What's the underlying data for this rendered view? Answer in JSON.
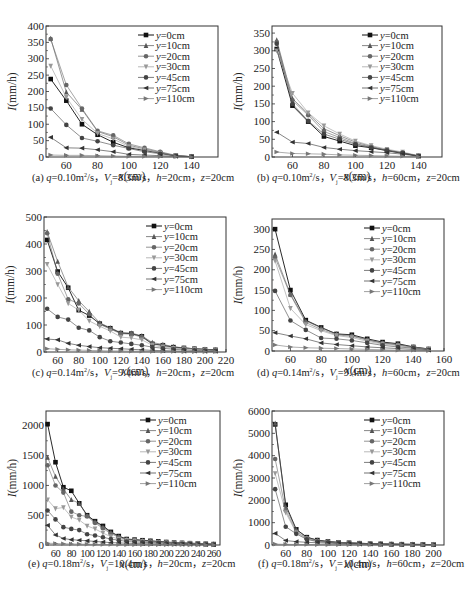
{
  "series_names": [
    "y=0cm",
    "y=10cm",
    "y=20cm",
    "y=30cm",
    "y=45cm",
    "y=75cm",
    "y=110cm"
  ],
  "styles": {
    "colors": [
      "#111111",
      "#555555",
      "#666666",
      "#999999",
      "#444444",
      "#333333",
      "#777777"
    ],
    "markers": [
      "square",
      "triangle",
      "circle",
      "tri-down",
      "circle",
      "tri-left",
      "tri-right"
    ]
  },
  "chart_data": [
    {
      "id": "a",
      "type": "line",
      "caption": {
        "label": "(a)",
        "q": "0.10",
        "Vj": "8.3",
        "h": "20",
        "z": "20"
      },
      "xlabel": "x(cm)",
      "ylabel": "I(mm/h)",
      "xlim": [
        47,
        157
      ],
      "ylim": [
        0,
        400
      ],
      "xticks": [
        60,
        80,
        100,
        120,
        140
      ],
      "yticks": [
        0,
        50,
        100,
        150,
        200,
        250,
        300,
        350,
        400
      ],
      "x": [
        50,
        60,
        70,
        80,
        90,
        100,
        110,
        120,
        130,
        140
      ],
      "series": [
        {
          "name": "y=0cm",
          "values": [
            238,
            172,
            100,
            68,
            45,
            28,
            20,
            12,
            4,
            1
          ]
        },
        {
          "name": "y=10cm",
          "values": [
            362,
            198,
            145,
            78,
            62,
            36,
            25,
            14,
            4,
            1
          ]
        },
        {
          "name": "y=20cm",
          "values": [
            360,
            220,
            148,
            80,
            66,
            40,
            28,
            16,
            5,
            1
          ]
        },
        {
          "name": "y=30cm",
          "values": [
            278,
            182,
            115,
            72,
            55,
            32,
            22,
            12,
            4,
            1
          ]
        },
        {
          "name": "y=45cm",
          "values": [
            148,
            98,
            58,
            48,
            36,
            26,
            16,
            10,
            3,
            1
          ]
        },
        {
          "name": "y=75cm",
          "values": [
            60,
            28,
            27,
            22,
            16,
            8,
            6,
            4,
            2,
            1
          ]
        },
        {
          "name": "y=110cm",
          "values": [
            6,
            5,
            5,
            4,
            3,
            2,
            2,
            1,
            1,
            0
          ]
        }
      ]
    },
    {
      "id": "b",
      "type": "line",
      "caption": {
        "label": "(b)",
        "q": "0.10",
        "Vj": "8.3",
        "h": "60",
        "z": "20"
      },
      "xlabel": "x(cm)",
      "ylabel": "I(mm/h)",
      "xlim": [
        47,
        155
      ],
      "ylim": [
        0,
        370
      ],
      "xticks": [
        60,
        80,
        100,
        120,
        140
      ],
      "yticks": [
        0,
        50,
        100,
        150,
        200,
        250,
        300,
        350
      ],
      "x": [
        50,
        60,
        70,
        80,
        90,
        100,
        110,
        120,
        130,
        140
      ],
      "series": [
        {
          "name": "y=0cm",
          "values": [
            305,
            145,
            100,
            58,
            45,
            32,
            26,
            18,
            10,
            3
          ]
        },
        {
          "name": "y=10cm",
          "values": [
            330,
            165,
            122,
            80,
            60,
            42,
            30,
            20,
            12,
            3
          ]
        },
        {
          "name": "y=20cm",
          "values": [
            325,
            160,
            118,
            72,
            55,
            38,
            28,
            18,
            11,
            3
          ]
        },
        {
          "name": "y=30cm",
          "values": [
            300,
            180,
            125,
            88,
            65,
            45,
            32,
            22,
            14,
            4
          ]
        },
        {
          "name": "y=45cm",
          "values": [
            320,
            150,
            102,
            65,
            50,
            36,
            27,
            19,
            12,
            3
          ]
        },
        {
          "name": "y=75cm",
          "values": [
            70,
            42,
            38,
            27,
            22,
            18,
            15,
            12,
            8,
            2
          ]
        },
        {
          "name": "y=110cm",
          "values": [
            14,
            10,
            9,
            8,
            6,
            5,
            4,
            3,
            2,
            1
          ]
        }
      ]
    },
    {
      "id": "c",
      "type": "line",
      "caption": {
        "label": "(c)",
        "q": "0.14",
        "Vj": "9.4",
        "h": "20",
        "z": "20"
      },
      "xlabel": "x(cm)",
      "ylabel": "I(mm/h)",
      "xlim": [
        47,
        220
      ],
      "ylim": [
        0,
        500
      ],
      "xticks": [
        60,
        80,
        100,
        120,
        140,
        160,
        180,
        200,
        220
      ],
      "yticks": [
        0,
        100,
        200,
        300,
        400,
        500
      ],
      "x": [
        50,
        60,
        70,
        80,
        90,
        100,
        110,
        120,
        130,
        140,
        150,
        160,
        170,
        180,
        190,
        200,
        210
      ],
      "series": [
        {
          "name": "y=0cm",
          "values": [
            415,
            298,
            238,
            155,
            135,
            105,
            88,
            70,
            68,
            58,
            30,
            25,
            18,
            15,
            12,
            10,
            8
          ]
        },
        {
          "name": "y=10cm",
          "values": [
            445,
            335,
            240,
            190,
            150,
            108,
            90,
            72,
            70,
            60,
            35,
            28,
            20,
            15,
            12,
            10,
            8
          ]
        },
        {
          "name": "y=20cm",
          "values": [
            440,
            290,
            195,
            180,
            140,
            102,
            85,
            68,
            66,
            55,
            30,
            24,
            16,
            14,
            12,
            9,
            6
          ]
        },
        {
          "name": "y=30cm",
          "values": [
            325,
            250,
            180,
            155,
            115,
            95,
            78,
            55,
            52,
            45,
            25,
            18,
            14,
            12,
            10,
            8,
            5
          ]
        },
        {
          "name": "y=45cm",
          "values": [
            160,
            130,
            120,
            90,
            80,
            55,
            40,
            35,
            30,
            25,
            18,
            14,
            10,
            8,
            6,
            5,
            4
          ]
        },
        {
          "name": "y=75cm",
          "values": [
            48,
            45,
            32,
            25,
            20,
            16,
            14,
            12,
            10,
            8,
            6,
            5,
            4,
            3,
            3,
            2,
            2
          ]
        },
        {
          "name": "y=110cm",
          "values": [
            12,
            10,
            8,
            7,
            6,
            5,
            4,
            4,
            3,
            3,
            2,
            2,
            2,
            1,
            1,
            1,
            1
          ]
        }
      ]
    },
    {
      "id": "d",
      "type": "line",
      "caption": {
        "label": "(d)",
        "q": "0.14",
        "Vj": "9.4",
        "h": "60",
        "z": "20"
      },
      "xlabel": "x(cm)",
      "ylabel": "I(mm/h)",
      "xlim": [
        48,
        160
      ],
      "ylim": [
        0,
        325
      ],
      "xticks": [
        60,
        80,
        100,
        120,
        140,
        160
      ],
      "yticks": [
        0,
        50,
        100,
        150,
        200,
        250,
        300
      ],
      "x": [
        50,
        60,
        70,
        80,
        90,
        100,
        110,
        120,
        130,
        140,
        150
      ],
      "series": [
        {
          "name": "y=0cm",
          "values": [
            300,
            150,
            76,
            58,
            42,
            40,
            30,
            22,
            18,
            10,
            5
          ]
        },
        {
          "name": "y=10cm",
          "values": [
            238,
            140,
            74,
            57,
            42,
            38,
            28,
            20,
            16,
            10,
            5
          ]
        },
        {
          "name": "y=20cm",
          "values": [
            230,
            138,
            70,
            53,
            40,
            36,
            27,
            19,
            15,
            9,
            4
          ]
        },
        {
          "name": "y=30cm",
          "values": [
            222,
            105,
            65,
            50,
            38,
            33,
            24,
            17,
            13,
            8,
            4
          ]
        },
        {
          "name": "y=45cm",
          "values": [
            148,
            75,
            52,
            32,
            30,
            26,
            20,
            14,
            10,
            7,
            3
          ]
        },
        {
          "name": "y=75cm",
          "values": [
            45,
            37,
            30,
            20,
            16,
            13,
            10,
            8,
            6,
            4,
            2
          ]
        },
        {
          "name": "y=110cm",
          "values": [
            15,
            10,
            8,
            7,
            6,
            5,
            4,
            3,
            2,
            2,
            1
          ]
        }
      ]
    },
    {
      "id": "e",
      "type": "line",
      "caption": {
        "label": "(e)",
        "q": "0.18",
        "Vj": "10.4",
        "h": "20",
        "z": "20"
      },
      "xlabel": "x(cm)",
      "ylabel": "I(mm/h)",
      "xlim": [
        48,
        268
      ],
      "ylim": [
        0,
        2250
      ],
      "xticks": [
        60,
        80,
        100,
        120,
        140,
        160,
        180,
        200,
        220,
        240,
        260
      ],
      "yticks": [
        0,
        500,
        1000,
        1500,
        2000
      ],
      "x": [
        50,
        60,
        70,
        80,
        90,
        100,
        110,
        120,
        130,
        140,
        150,
        160,
        170,
        180,
        190,
        200,
        210,
        220,
        230,
        240,
        250,
        260
      ],
      "series": [
        {
          "name": "y=0cm",
          "values": [
            2030,
            1390,
            970,
            910,
            700,
            500,
            400,
            320,
            220,
            150,
            100,
            90,
            80,
            70,
            60,
            50,
            40,
            35,
            30,
            25,
            20,
            15
          ]
        },
        {
          "name": "y=10cm",
          "values": [
            1470,
            1150,
            940,
            760,
            700,
            490,
            390,
            300,
            210,
            140,
            95,
            85,
            75,
            65,
            55,
            45,
            38,
            32,
            28,
            24,
            18,
            14
          ]
        },
        {
          "name": "y=20cm",
          "values": [
            1340,
            1000,
            880,
            560,
            500,
            480,
            370,
            280,
            190,
            130,
            90,
            80,
            70,
            60,
            50,
            42,
            36,
            30,
            26,
            22,
            17,
            13
          ]
        },
        {
          "name": "y=30cm",
          "values": [
            760,
            610,
            630,
            470,
            420,
            320,
            270,
            200,
            140,
            100,
            80,
            70,
            60,
            50,
            44,
            38,
            32,
            28,
            24,
            20,
            16,
            12
          ]
        },
        {
          "name": "y=45cm",
          "values": [
            580,
            430,
            300,
            270,
            250,
            180,
            160,
            130,
            100,
            80,
            60,
            50,
            45,
            40,
            35,
            30,
            26,
            22,
            20,
            16,
            13,
            10
          ]
        },
        {
          "name": "y=75cm",
          "values": [
            330,
            170,
            110,
            90,
            80,
            70,
            60,
            50,
            40,
            35,
            30,
            25,
            22,
            20,
            18,
            15,
            13,
            11,
            10,
            8,
            7,
            6
          ]
        },
        {
          "name": "y=110cm",
          "values": [
            30,
            25,
            20,
            18,
            15,
            12,
            10,
            9,
            8,
            7,
            6,
            5,
            5,
            4,
            4,
            3,
            3,
            3,
            2,
            2,
            2,
            2
          ]
        }
      ]
    },
    {
      "id": "f",
      "type": "line",
      "caption": {
        "label": "(f)",
        "q": "0.18",
        "Vj": "10.4",
        "h": "60",
        "z": "20"
      },
      "xlabel": "x(cm)",
      "ylabel": "I(mm/h)",
      "xlim": [
        47,
        210
      ],
      "ylim": [
        0,
        6000
      ],
      "xticks": [
        60,
        80,
        100,
        120,
        140,
        160,
        180,
        200
      ],
      "yticks": [
        0,
        1000,
        2000,
        3000,
        4000,
        5000,
        6000
      ],
      "x": [
        50,
        60,
        70,
        80,
        90,
        100,
        110,
        120,
        130,
        140,
        150,
        160,
        170,
        180,
        190,
        200
      ],
      "series": [
        {
          "name": "y=0cm",
          "values": [
            5400,
            1800,
            700,
            350,
            220,
            160,
            120,
            100,
            80,
            60,
            50,
            40,
            35,
            30,
            25,
            20
          ]
        },
        {
          "name": "y=10cm",
          "values": [
            5450,
            1700,
            680,
            340,
            210,
            150,
            115,
            95,
            75,
            58,
            48,
            38,
            33,
            28,
            24,
            18
          ]
        },
        {
          "name": "y=20cm",
          "values": [
            3850,
            1550,
            600,
            300,
            190,
            140,
            105,
            90,
            70,
            55,
            45,
            36,
            30,
            26,
            22,
            17
          ]
        },
        {
          "name": "y=30cm",
          "values": [
            3200,
            1450,
            550,
            280,
            170,
            130,
            100,
            85,
            65,
            52,
            42,
            34,
            28,
            24,
            20,
            16
          ]
        },
        {
          "name": "y=45cm",
          "values": [
            2500,
            820,
            500,
            250,
            150,
            120,
            90,
            75,
            60,
            48,
            40,
            32,
            26,
            22,
            18,
            14
          ]
        },
        {
          "name": "y=75cm",
          "values": [
            520,
            200,
            150,
            120,
            100,
            80,
            60,
            50,
            40,
            35,
            30,
            25,
            20,
            18,
            15,
            12
          ]
        },
        {
          "name": "y=110cm",
          "values": [
            40,
            30,
            25,
            20,
            18,
            15,
            12,
            10,
            9,
            8,
            7,
            6,
            5,
            5,
            4,
            4
          ]
        }
      ]
    }
  ],
  "layout": {
    "panels": [
      {
        "id": "a",
        "left": 0,
        "top": 0,
        "box": {
          "x": 46,
          "y": 26,
          "w": 172,
          "h": 131
        },
        "cap_x": 32,
        "cap_y": 177
      },
      {
        "id": "b",
        "left": 0,
        "top": 0,
        "box": {
          "x": 272,
          "y": 26,
          "w": 170,
          "h": 131
        },
        "cap_x": 257,
        "cap_y": 177
      },
      {
        "id": "c",
        "left": 0,
        "top": 0,
        "box": {
          "x": 44,
          "y": 217,
          "w": 182,
          "h": 135
        },
        "cap_x": 32,
        "cap_y": 372
      },
      {
        "id": "d",
        "left": 0,
        "top": 0,
        "box": {
          "x": 272,
          "y": 219,
          "w": 172,
          "h": 132
        },
        "cap_x": 257,
        "cap_y": 372
      },
      {
        "id": "e",
        "left": 0,
        "top": 0,
        "box": {
          "x": 46,
          "y": 411,
          "w": 174,
          "h": 134
        },
        "cap_x": 28,
        "cap_y": 563
      },
      {
        "id": "f",
        "left": 0,
        "top": 0,
        "box": {
          "x": 272,
          "y": 411,
          "w": 172,
          "h": 134
        },
        "cap_x": 258,
        "cap_y": 563
      }
    ]
  }
}
